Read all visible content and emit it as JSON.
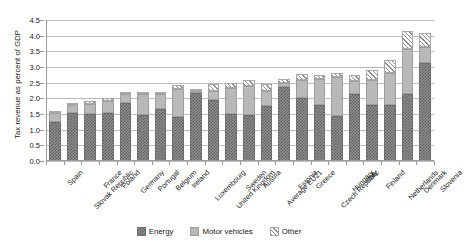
{
  "chart_data": {
    "type": "bar",
    "stacked": true,
    "title": "",
    "xlabel": "",
    "ylabel": "Tax revenue as percent of GDP",
    "ylim": [
      0.0,
      4.5
    ],
    "ytick_step": 0.5,
    "ytick_labels": [
      "0.0",
      "0.5",
      "1.0",
      "1.5",
      "2.0",
      "2.5",
      "3.0",
      "3.5",
      "4.0",
      "4.5"
    ],
    "grid": true,
    "legend_position": "bottom",
    "categories": [
      "Spain",
      "Slovak Republic",
      "France",
      "Poland",
      "Germany",
      "Portugal",
      "Belgium",
      "Ireland",
      "Luxembourg",
      "United Kingdom",
      "Sweden",
      "Austria",
      "Average EU21",
      "Estonia",
      "Greece",
      "Czech Republic",
      "Hungary",
      "Italy",
      "Finland",
      "Netherlands",
      "Denmark",
      "Slovenia"
    ],
    "series": [
      {
        "name": "Energy",
        "color": "#6e6e6e",
        "pattern": "checker",
        "values": [
          1.26,
          1.52,
          1.5,
          1.52,
          1.84,
          1.46,
          1.66,
          1.4,
          2.18,
          1.96,
          1.5,
          1.48,
          1.74,
          2.36,
          2.02,
          1.8,
          1.44,
          2.14,
          1.78,
          1.78,
          2.14,
          3.14
        ]
      },
      {
        "name": "Motor vehicles",
        "color": "#b9b9b9",
        "pattern": "solid",
        "values": [
          0.28,
          0.26,
          0.32,
          0.38,
          0.3,
          0.68,
          0.48,
          0.9,
          0.04,
          0.26,
          0.82,
          0.9,
          0.48,
          0.14,
          0.56,
          0.82,
          1.24,
          0.4,
          0.82,
          1.04,
          1.44,
          0.5
        ]
      },
      {
        "name": "Other",
        "color": "#8d8d8d",
        "pattern": "hatch",
        "values": [
          0.06,
          0.04,
          0.08,
          0.1,
          0.04,
          0.04,
          0.06,
          0.12,
          0.06,
          0.24,
          0.18,
          0.22,
          0.24,
          0.12,
          0.2,
          0.14,
          0.14,
          0.22,
          0.3,
          0.4,
          0.56,
          0.44
        ]
      }
    ],
    "totals": [
      1.6,
      1.82,
      1.9,
      2.0,
      2.18,
      2.18,
      2.2,
      2.42,
      2.28,
      2.46,
      2.5,
      2.6,
      2.46,
      2.62,
      2.78,
      2.76,
      2.82,
      2.76,
      2.9,
      3.22,
      4.14,
      4.08
    ]
  },
  "legend": {
    "items": [
      {
        "label": "Energy"
      },
      {
        "label": "Motor vehicles"
      },
      {
        "label": "Other"
      }
    ]
  }
}
